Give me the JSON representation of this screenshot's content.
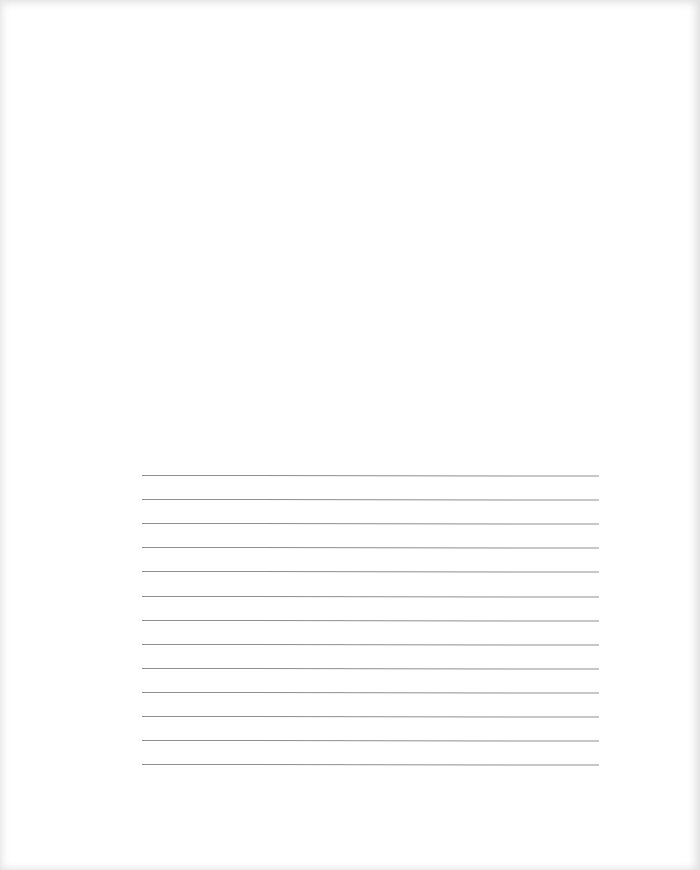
{
  "document": {
    "type": "blank ruled page",
    "text_content": "",
    "ruled_lines": {
      "count": 13,
      "start_y": 0,
      "spacing_px": 24.1,
      "color": "#8f8f8f"
    }
  }
}
